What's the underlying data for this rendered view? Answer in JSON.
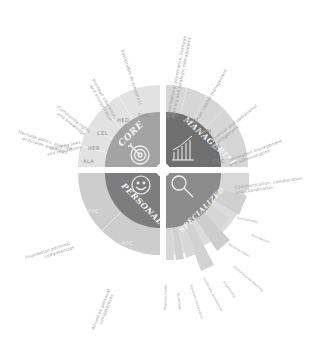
{
  "diagram": {
    "center": [
      163,
      170
    ],
    "colors": {
      "core": "#a3a3a3",
      "managerial": "#6f6f6f",
      "personal": "#7d7d7d",
      "specialized": "#8c8c8c",
      "ring_light": "#dedede",
      "ring_mid": "#cfcfcf",
      "divider": "#ffffff",
      "label": "#9a9a9a"
    },
    "quadrants": [
      {
        "id": "core",
        "label": "CORE",
        "icon": "target-icon"
      },
      {
        "id": "managerial",
        "label": "MANAGERIAL",
        "icon": "bar-chart-icon"
      },
      {
        "id": "personal",
        "label": "PERSONAL",
        "icon": "smiley-icon"
      },
      {
        "id": "specialized",
        "label": "SPECIALIZED",
        "icon": "magnifier-icon"
      }
    ],
    "core_segments": [
      {
        "code": "ALA",
        "label_line1": "Applying laws",
        "label_line2": "and regulations"
      },
      {
        "code": "HER",
        "label_line1": "Heritage policy, practice,",
        "label_line2": "principles and ethics"
      },
      {
        "code": "CEL",
        "label_line1": "Community rights",
        "label_line2": "and knowledge"
      },
      {
        "code": "HED",
        "label_line1": "Heritage education",
        "label_line2": "and interpretation"
      },
      {
        "code": "SVS",
        "label_line1": "Sustainable development",
        "label_line2": ""
      }
    ],
    "managerial_segments": [
      {
        "code": "OPM",
        "label_line1": "Organizational governance, heritage",
        "label_line2": "planning and strategic management"
      },
      {
        "code": "HCM",
        "label_line1": "Human capital management",
        "label_line2": ""
      },
      {
        "code": "FOM",
        "label_line1": "Financial and operational",
        "label_line2": "management"
      },
      {
        "code": "IMA",
        "label_line1": "Information management",
        "label_line2": "and administration"
      },
      {
        "code": "CCC",
        "label_line1": "Communication, collaboration",
        "label_line2": "and coordination"
      }
    ],
    "personal_segments": [
      {
        "code": "FPC",
        "label_line1": "Foundation personal",
        "label_line2": "competencies"
      },
      {
        "code": "APC",
        "label_line1": "Advanced personal",
        "label_line2": "competencies"
      }
    ],
    "specialized_segments": [
      {
        "label": "Anthropology"
      },
      {
        "label": "Architecture"
      },
      {
        "label": "Building trades"
      },
      {
        "label": "Environmental planning"
      },
      {
        "label": "Engineering"
      },
      {
        "label": "Landscape architecture"
      },
      {
        "label": "Materials conservation"
      },
      {
        "label": "Museology"
      },
      {
        "label": "Regional studies"
      }
    ]
  }
}
